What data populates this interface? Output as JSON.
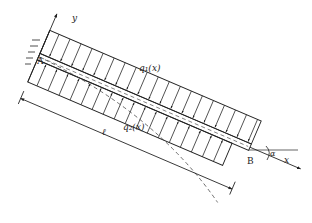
{
  "figure": {
    "type": "inclined cantilever beam with distributed loads",
    "labels": {
      "y_axis": "y",
      "x_axis": "x",
      "point_a": "A",
      "point_b": "B",
      "load_top": "q₁(x)",
      "load_bottom": "q₂(x)",
      "length": "ℓ",
      "angle": "α"
    },
    "colors": {
      "line": "#222222",
      "background": "#ffffff"
    }
  }
}
